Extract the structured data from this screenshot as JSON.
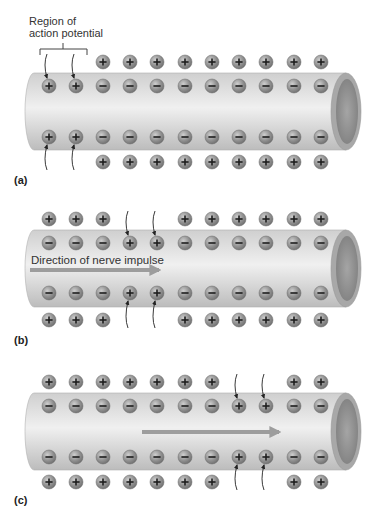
{
  "figure": {
    "region_label_line1": "Region of",
    "region_label_line2": "action potential",
    "direction_label": "Direction of nerve impulse",
    "colors": {
      "tube_top": "#cfcfcf",
      "tube_mid": "#efefef",
      "tube_bottom": "#bdbdbd",
      "tube_end_ring": "#a8a8a8",
      "tube_end_inner": "#8c8c8c",
      "ion_fill": "#8e8e8e",
      "ion_highlight": "#c4c4c4",
      "sign": "#1e1e1e",
      "arrow": "#9d9d9d"
    },
    "ion_x": [
      49,
      76,
      103,
      130,
      157,
      185,
      212,
      239,
      266,
      294,
      321
    ],
    "panels": [
      {
        "label": "(a)",
        "tube_top": 73,
        "tube_bottom": 150,
        "outer_top_y": 62,
        "inner_top_y": 86,
        "inner_bottom_y": 137,
        "outer_bottom_y": 162,
        "label_y": 174,
        "outer": [
          "",
          "",
          "+",
          "+",
          "+",
          "+",
          "+",
          "+",
          "+",
          "+",
          "+"
        ],
        "inner": [
          "+",
          "+",
          "-",
          "-",
          "-",
          "-",
          "-",
          "-",
          "-",
          "-",
          "-"
        ],
        "influx_arrows": [
          0,
          1
        ],
        "impulse_arrow": null
      },
      {
        "label": "(b)",
        "tube_top": 230,
        "tube_bottom": 307,
        "outer_top_y": 219,
        "inner_top_y": 243,
        "inner_bottom_y": 293,
        "outer_bottom_y": 320,
        "label_y": 334,
        "outer": [
          "+",
          "+",
          "+",
          "",
          "",
          "+",
          "+",
          "+",
          "+",
          "+",
          "+"
        ],
        "inner": [
          "-",
          "-",
          "-",
          "+",
          "+",
          "-",
          "-",
          "-",
          "-",
          "-",
          "-"
        ],
        "influx_arrows": [
          3,
          4
        ],
        "impulse_arrow": {
          "x1": 30,
          "x2": 163,
          "y": 270
        }
      },
      {
        "label": "(c)",
        "tube_top": 393,
        "tube_bottom": 470,
        "outer_top_y": 382,
        "inner_top_y": 406,
        "inner_bottom_y": 457,
        "outer_bottom_y": 482,
        "label_y": 494,
        "outer": [
          "+",
          "+",
          "+",
          "+",
          "+",
          "+",
          "+",
          "",
          "",
          "+",
          "+"
        ],
        "inner": [
          "-",
          "-",
          "-",
          "-",
          "-",
          "-",
          "-",
          "+",
          "+",
          "-",
          "-"
        ],
        "influx_arrows": [
          7,
          8
        ],
        "impulse_arrow": {
          "x1": 142,
          "x2": 283,
          "y": 432
        }
      }
    ]
  }
}
